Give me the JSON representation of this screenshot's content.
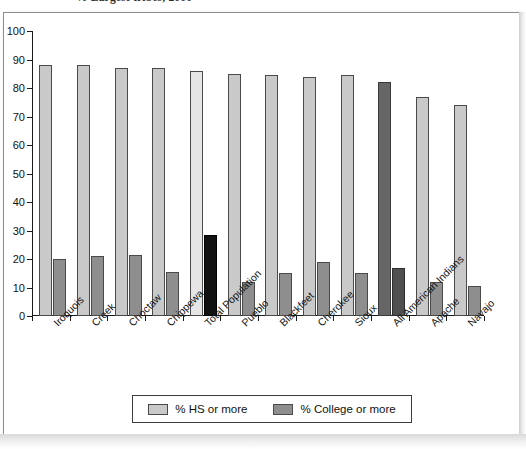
{
  "page": {
    "title_partial": "% Largest tribes, 2000"
  },
  "chart_data": {
    "type": "bar",
    "title": "",
    "xlabel": "",
    "ylabel": "",
    "ylim": [
      0,
      100
    ],
    "ytick_step": 10,
    "yticks": [
      "0",
      "10",
      "20",
      "30",
      "40",
      "50",
      "60",
      "70",
      "80",
      "90",
      "100"
    ],
    "grid": false,
    "legend_position": "bottom-center",
    "categories": [
      "Iroquois",
      "Creek",
      "Choctaw",
      "Chippewa",
      "Total Population",
      "Pueblo",
      "Blackfeet",
      "Cherokee",
      "Sioux",
      "All American Indians",
      "Apache",
      "Navajo"
    ],
    "series": [
      {
        "name": "% HS or more",
        "color": "#c9c9c9",
        "values": [
          88,
          88,
          87,
          87,
          86,
          85,
          84.5,
          84,
          84.5,
          82,
          77,
          74
        ]
      },
      {
        "name": "% College or more",
        "color": "#8e8e8e",
        "values": [
          20,
          21,
          21.5,
          15.5,
          28.5,
          12,
          15,
          19,
          15,
          17,
          12,
          10.5
        ]
      }
    ],
    "highlighted_categories": [
      "Total Population",
      "All American Indians"
    ],
    "legend": [
      {
        "label": "% HS or more",
        "swatch": "hs"
      },
      {
        "label": "% College or more",
        "swatch": "col"
      }
    ]
  }
}
